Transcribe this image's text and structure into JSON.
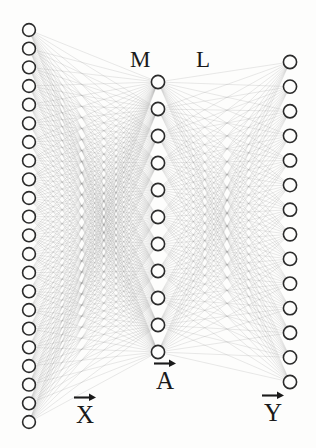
{
  "figure": {
    "kind": "neural-network-layer-diagram",
    "background_color": "#fdfdfc",
    "ink_color": "#2b2b2b",
    "edge_color": "#8c8c8c",
    "width": 316,
    "height": 448
  },
  "layers": [
    {
      "id": "input",
      "name": "input-layer",
      "label": "X",
      "label_has_vector_arrow": true,
      "node_count": 22,
      "x": 29,
      "y_top": 30,
      "y_bottom": 422,
      "node_radius": 6.4
    },
    {
      "id": "hidden",
      "name": "hidden-layer",
      "label": "A",
      "label_has_vector_arrow": true,
      "node_count": 11,
      "x": 158,
      "y_top": 82,
      "y_bottom": 352,
      "node_radius": 6.6
    },
    {
      "id": "output",
      "name": "output-layer",
      "label": "Y",
      "label_has_vector_arrow": true,
      "node_count": 14,
      "x": 290,
      "y_top": 62,
      "y_bottom": 382,
      "node_radius": 6.6
    }
  ],
  "connections": [
    {
      "id": "M",
      "from": "input",
      "to": "hidden",
      "label": "M",
      "label_x": 130,
      "label_y": 48
    },
    {
      "id": "L",
      "from": "hidden",
      "to": "output",
      "label": "L",
      "label_x": 196,
      "label_y": 48
    }
  ],
  "labels": {
    "matrix_m": "M",
    "matrix_l": "L",
    "vector_x": "X",
    "vector_a": "A",
    "vector_y": "Y"
  },
  "label_positions": {
    "vector_x": {
      "x": 73,
      "y": 392
    },
    "vector_a": {
      "x": 153,
      "y": 358
    },
    "vector_y": {
      "x": 261,
      "y": 390
    }
  }
}
